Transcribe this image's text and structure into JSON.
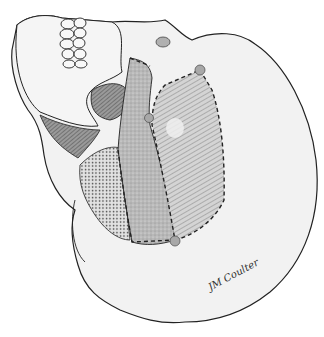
{
  "figure": {
    "type": "anatomical-illustration",
    "colors": {
      "background": "#ffffff",
      "bone_fill": "#f1f1f1",
      "outline": "#222222",
      "hatch_region": "#c9c9c9",
      "stipple_medium": "#bdbdbd",
      "stipple_light": "#d9d9d9",
      "dark_shade": "#7a7a7a",
      "landmark_dot": "#a8a8a8"
    },
    "regions": [
      {
        "name": "hatched-region",
        "pattern": "diagonal-hatch"
      },
      {
        "name": "medium-stipple-region",
        "pattern": "fine-stipple"
      },
      {
        "name": "coarse-stipple-region",
        "pattern": "coarse-dots"
      }
    ],
    "landmarks": [
      {
        "name": "landmark-top",
        "x": 200,
        "y": 70
      },
      {
        "name": "landmark-mid",
        "x": 149,
        "y": 118
      },
      {
        "name": "landmark-bottom",
        "x": 175,
        "y": 241
      }
    ],
    "signature": "JM Coulter"
  }
}
